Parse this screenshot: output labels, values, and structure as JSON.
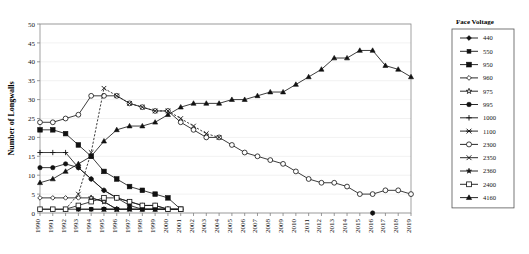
{
  "chart_data": {
    "type": "line",
    "title": "",
    "xlabel": "",
    "ylabel": "Number of Longwalls",
    "ylim": [
      0,
      50
    ],
    "ytick_step": 5,
    "yticks": [
      0,
      5,
      10,
      15,
      20,
      25,
      30,
      35,
      40,
      45,
      50
    ],
    "grid": true,
    "legend_position": "right",
    "legend_title": "Face Voltage",
    "x": [
      1990,
      1991,
      1992,
      1993,
      1994,
      1995,
      1996,
      1997,
      1998,
      1999,
      2000,
      2001,
      2002,
      2003,
      2004,
      2005,
      2006,
      2007,
      2008,
      2009,
      2010,
      2011,
      2012,
      2013,
      2014,
      2015,
      2016,
      2017,
      2018,
      2019
    ],
    "categories": [
      "1990",
      "1991",
      "1992",
      "1993",
      "1994",
      "1995",
      "1996",
      "1997",
      "1998",
      "1999",
      "2000",
      "2001",
      "2002",
      "2003",
      "2004",
      "2005",
      "2006",
      "2007",
      "2008",
      "2009",
      "2010",
      "2011",
      "2012",
      "2013",
      "2014",
      "2015",
      "2016",
      "2017",
      "2018",
      "2019"
    ],
    "series": [
      {
        "name": "440",
        "marker": "diamond-filled",
        "dashed": false,
        "values": [
          1,
          1,
          1,
          1,
          1,
          1,
          null,
          null,
          null,
          null,
          null,
          null,
          null,
          null,
          null,
          null,
          null,
          null,
          null,
          null,
          null,
          null,
          null,
          null,
          null,
          null,
          null,
          null,
          null,
          null
        ]
      },
      {
        "name": "550",
        "marker": "square-filled-small",
        "dashed": false,
        "values": [
          null,
          null,
          null,
          1,
          1,
          1,
          1,
          1,
          1,
          1,
          1,
          1,
          null,
          null,
          null,
          null,
          null,
          null,
          null,
          null,
          null,
          null,
          null,
          null,
          null,
          null,
          null,
          null,
          null,
          null
        ]
      },
      {
        "name": "950",
        "marker": "square-filled",
        "dashed": false,
        "values": [
          22,
          22,
          21,
          18,
          15,
          11,
          9,
          7,
          6,
          5,
          4,
          1,
          null,
          null,
          null,
          null,
          null,
          null,
          null,
          null,
          null,
          null,
          null,
          null,
          null,
          null,
          null,
          null,
          null,
          null
        ]
      },
      {
        "name": "960",
        "marker": "diamond-open",
        "dashed": false,
        "values": [
          4,
          4,
          4,
          4,
          4,
          3,
          1,
          null,
          null,
          null,
          null,
          null,
          null,
          null,
          null,
          null,
          null,
          null,
          null,
          null,
          null,
          null,
          null,
          null,
          null,
          null,
          null,
          null,
          null,
          null
        ]
      },
      {
        "name": "975",
        "marker": "star-open",
        "dashed": false,
        "values": [
          null,
          null,
          null,
          null,
          4,
          3,
          1,
          null,
          null,
          null,
          null,
          null,
          null,
          null,
          null,
          null,
          null,
          null,
          null,
          null,
          null,
          null,
          null,
          null,
          null,
          null,
          null,
          null,
          null,
          null
        ]
      },
      {
        "name": "995",
        "marker": "circle-filled",
        "dashed": false,
        "values": [
          12,
          12,
          13,
          12,
          9,
          6,
          4,
          2,
          1,
          1,
          1,
          1,
          null,
          null,
          null,
          null,
          null,
          null,
          null,
          null,
          null,
          null,
          null,
          null,
          null,
          null,
          0,
          null,
          null,
          null
        ]
      },
      {
        "name": "1000",
        "marker": "plus",
        "dashed": false,
        "values": [
          16,
          16,
          16,
          12,
          9,
          6,
          4,
          3,
          2,
          2,
          1,
          null,
          null,
          null,
          null,
          null,
          null,
          null,
          null,
          null,
          null,
          null,
          null,
          null,
          null,
          null,
          null,
          null,
          null,
          null
        ]
      },
      {
        "name": "1100",
        "marker": "asterisk",
        "dashed": false,
        "values": [
          null,
          null,
          null,
          null,
          null,
          1,
          1,
          1,
          1,
          1,
          1,
          1,
          null,
          null,
          null,
          null,
          null,
          null,
          null,
          null,
          null,
          null,
          null,
          null,
          null,
          null,
          null,
          null,
          null,
          null
        ]
      },
      {
        "name": "2300",
        "marker": "circle-open",
        "dashed": false,
        "values": [
          24,
          24,
          25,
          26,
          31,
          31,
          31,
          29,
          28,
          27,
          27,
          24,
          22,
          20,
          20,
          18,
          16,
          15,
          14,
          13,
          11,
          9,
          8,
          8,
          7,
          5,
          5,
          6,
          6,
          5
        ]
      },
      {
        "name": "2350",
        "marker": "x",
        "dashed": true,
        "values": [
          null,
          null,
          1,
          5,
          16,
          33,
          31,
          29,
          28,
          27,
          27,
          25,
          23,
          21,
          20,
          null,
          null,
          null,
          null,
          null,
          null,
          null,
          null,
          null,
          null,
          null,
          null,
          null,
          null,
          null
        ]
      },
      {
        "name": "2360",
        "marker": "star-filled",
        "dashed": false,
        "values": [
          null,
          null,
          null,
          null,
          null,
          1,
          1,
          1,
          1,
          1,
          1,
          null,
          null,
          null,
          null,
          null,
          null,
          null,
          null,
          null,
          null,
          null,
          null,
          null,
          null,
          null,
          null,
          null,
          null,
          null
        ]
      },
      {
        "name": "2400",
        "marker": "square-open",
        "dashed": false,
        "values": [
          1,
          1,
          1,
          2,
          3,
          4,
          4,
          3,
          2,
          2,
          1,
          1,
          null,
          null,
          null,
          null,
          null,
          null,
          null,
          null,
          null,
          null,
          null,
          null,
          null,
          null,
          null,
          null,
          null,
          null
        ]
      },
      {
        "name": "4160",
        "marker": "triangle-filled",
        "dashed": false,
        "values": [
          8,
          9,
          11,
          13,
          15,
          19,
          22,
          23,
          23,
          24,
          26,
          28,
          29,
          29,
          29,
          30,
          30,
          31,
          32,
          32,
          34,
          36,
          38,
          41,
          41,
          43,
          43,
          39,
          38,
          36
        ]
      }
    ]
  },
  "axis": {
    "y_tick_labels": [
      "0",
      "5",
      "10",
      "15",
      "20",
      "25",
      "30",
      "35",
      "40",
      "45",
      "50"
    ],
    "y_axis_title": "Number of Longwalls",
    "x_tick_labels": [
      "1990",
      "1991",
      "1992",
      "1993",
      "1994",
      "1995",
      "1996",
      "1997",
      "1998",
      "1999",
      "2000",
      "2001",
      "2002",
      "2003",
      "2004",
      "2005",
      "2006",
      "2007",
      "2008",
      "2009",
      "2010",
      "2011",
      "2012",
      "2013",
      "2014",
      "2015",
      "2016",
      "2017",
      "2018",
      "2019"
    ]
  },
  "legend": {
    "title": "Face Voltage",
    "items": [
      {
        "label": "440",
        "marker": "diamond-filled"
      },
      {
        "label": "550",
        "marker": "square-filled-small"
      },
      {
        "label": "950",
        "marker": "square-filled"
      },
      {
        "label": "960",
        "marker": "diamond-open"
      },
      {
        "label": "975",
        "marker": "star-open"
      },
      {
        "label": "995",
        "marker": "circle-filled"
      },
      {
        "label": "1000",
        "marker": "plus"
      },
      {
        "label": "1100",
        "marker": "asterisk"
      },
      {
        "label": "2300",
        "marker": "circle-open"
      },
      {
        "label": "2350",
        "marker": "x"
      },
      {
        "label": "2360",
        "marker": "star-filled"
      },
      {
        "label": "2400",
        "marker": "square-open"
      },
      {
        "label": "4160",
        "marker": "triangle-filled"
      }
    ]
  },
  "colors": {
    "ink": "#111111",
    "grid": "#e8e8e8",
    "axis": "#808080",
    "background": "#ffffff"
  }
}
